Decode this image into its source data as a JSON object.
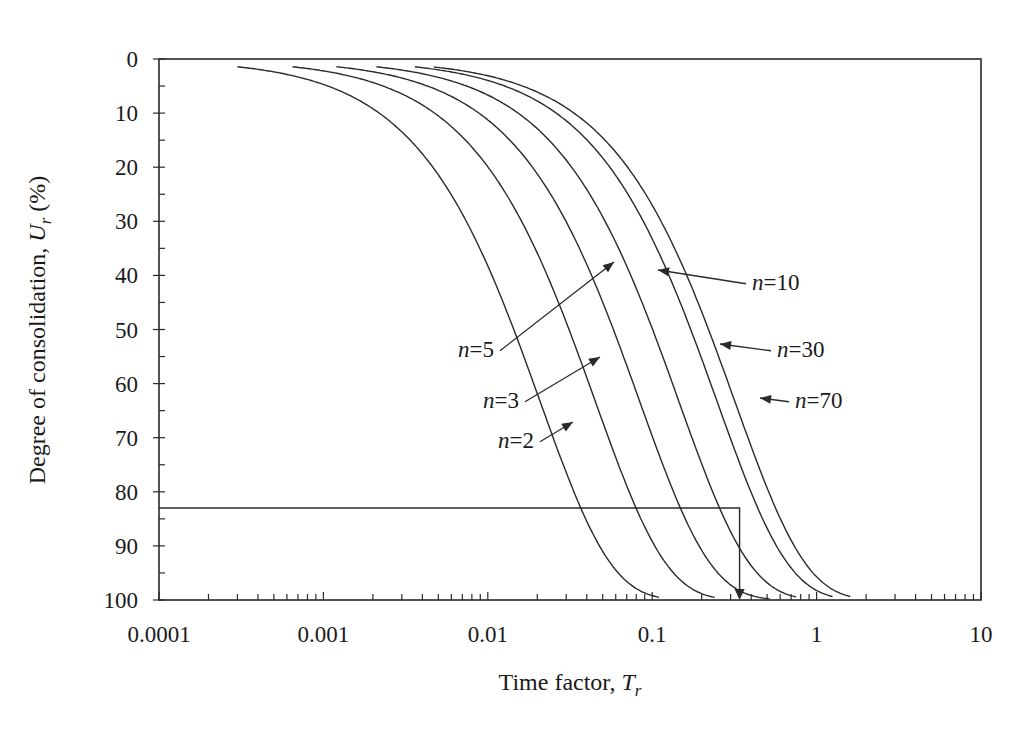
{
  "chart_data": {
    "type": "line",
    "title": "",
    "xlabel": "Time factor, T",
    "xlabel_subscript": "r",
    "ylabel": "Degree of consolidation, U",
    "ylabel_subscript": "r",
    "ylabel_suffix": " (%)",
    "xscale": "log",
    "xlim": [
      0.0001,
      10
    ],
    "ylim": [
      0,
      100
    ],
    "y_inverted": true,
    "x_ticks": [
      "0.0001",
      "0.001",
      "0.01",
      "0.1",
      "1",
      "10"
    ],
    "y_ticks": [
      "0",
      "10",
      "20",
      "30",
      "40",
      "50",
      "60",
      "70",
      "80",
      "90",
      "100"
    ],
    "grid": false,
    "legend": "none (inline annotations)",
    "series": [
      {
        "name": "n=2",
        "n": 2,
        "F": 0.166,
        "T_start": 0.0003,
        "T_end": 0.11,
        "x": [
          0.0003,
          0.002,
          0.005,
          0.01,
          0.021,
          0.04,
          0.07,
          0.11
        ],
        "y": [
          1,
          9,
          21,
          38,
          50,
          72,
          91,
          98
        ]
      },
      {
        "name": "n=3",
        "n": 3,
        "F": 0.36,
        "T_start": 0.00065,
        "T_end": 0.24,
        "x": [
          0.00065,
          0.004,
          0.01,
          0.02,
          0.046,
          0.08,
          0.15,
          0.24
        ],
        "y": [
          1,
          8,
          20,
          36,
          50,
          72,
          91,
          98
        ]
      },
      {
        "name": "n=5",
        "n": 5,
        "F": 0.67,
        "T_start": 0.0012,
        "T_end": 0.52,
        "x": [
          0.0012,
          0.007,
          0.02,
          0.04,
          0.085,
          0.15,
          0.28,
          0.52
        ],
        "y": [
          1,
          8,
          21,
          38,
          50,
          72,
          91,
          98
        ]
      },
      {
        "name": "n=10",
        "n": 10,
        "F": 1.16,
        "T_start": 0.0021,
        "T_end": 0.75,
        "x": [
          0.0021,
          0.012,
          0.03,
          0.07,
          0.147,
          0.26,
          0.48,
          0.75
        ],
        "y": [
          1,
          8,
          19,
          38,
          50,
          72,
          91,
          98
        ]
      },
      {
        "name": "n=30",
        "n": 30,
        "F": 1.98,
        "T_start": 0.0036,
        "T_end": 1.25,
        "x": [
          0.0036,
          0.02,
          0.05,
          0.12,
          0.25,
          0.45,
          0.82,
          1.25
        ],
        "y": [
          1,
          8,
          18,
          38,
          50,
          72,
          91,
          98
        ]
      },
      {
        "name": "n=70",
        "n": 70,
        "F": 2.54,
        "T_start": 0.0047,
        "T_end": 1.6,
        "x": [
          0.0047,
          0.026,
          0.065,
          0.15,
          0.32,
          0.58,
          1.05,
          1.6
        ],
        "y": [
          1,
          8,
          18,
          38,
          50,
          72,
          91,
          98
        ]
      }
    ],
    "annotations": [
      {
        "text_italic": "n",
        "text": "=10",
        "label_x": 752,
        "label_y": 290,
        "arrow_to": [
          658,
          270
        ]
      },
      {
        "text_italic": "n",
        "text": "=5",
        "label_x": 458,
        "label_y": 357,
        "arrow_to": [
          614,
          262
        ]
      },
      {
        "text_italic": "n",
        "text": "=30",
        "label_x": 777,
        "label_y": 357,
        "arrow_to": [
          720,
          344
        ]
      },
      {
        "text_italic": "n",
        "text": "=3",
        "label_x": 483,
        "label_y": 408,
        "arrow_to": [
          600,
          357
        ]
      },
      {
        "text_italic": "n",
        "text": "=70",
        "label_x": 795,
        "label_y": 408,
        "arrow_to": [
          760,
          398
        ]
      },
      {
        "text_italic": "n",
        "text": "=2",
        "label_x": 498,
        "label_y": 448,
        "arrow_to": [
          573,
          422
        ]
      }
    ],
    "guide_lines": {
      "U_percent": 83,
      "T": 0.34,
      "description": "horizontal line from y-axis at U=83% to T≈0.34, then vertical arrow down to x-axis"
    }
  }
}
